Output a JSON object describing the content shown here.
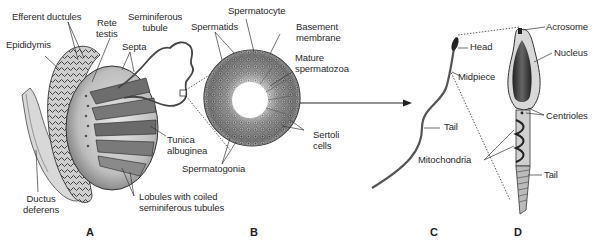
{
  "figure": {
    "panels": [
      "A",
      "B",
      "C",
      "D"
    ],
    "labels": {
      "a": {
        "efferent_ductules": "Efferent ductules",
        "rete_testis": "Rete\ntestis",
        "epididymis": "Epididymis",
        "seminiferous_tubule": "Seminiferous\ntubule",
        "septa": "Septa",
        "tunica_albuginea": "Tunica\nalbuginea",
        "ductus_deferens": "Ductus\ndeferens",
        "lobules": "Lobules with coiled\nseminiferous tubules"
      },
      "b": {
        "spermatocyte": "Spermatocyte",
        "spermatids": "Spermatids",
        "basement_membrane": "Basement\nmembrane",
        "mature_spermatozoa": "Mature\nspermatozoa",
        "sertoli_cells": "Sertoli\ncells",
        "spermatogonia": "Spermatogonia"
      },
      "c": {
        "head": "Head",
        "midpiece": "Midpiece",
        "tail": "Tail"
      },
      "d": {
        "acrosome": "Acrosome",
        "nucleus": "Nucleus",
        "centrioles": "Centrioles",
        "mitochondria": "Mitochondria",
        "tail": "Tail"
      }
    },
    "colors": {
      "ink": "#2a2a2a",
      "tissue_light": "#d9d9d9",
      "tissue_mid": "#9a9a9a",
      "tissue_dark": "#3a3a3a",
      "background": "#ffffff"
    }
  }
}
